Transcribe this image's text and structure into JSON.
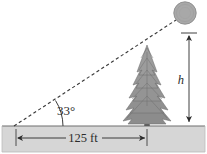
{
  "figure": {
    "type": "geometry-diagram",
    "labels": {
      "angle_of_elevation": "33°",
      "base_distance": "125 ft",
      "height_variable": "h"
    },
    "elements": {
      "sun": "sun-circle",
      "tree": "evergreen-tree",
      "ground": "ground-band",
      "hypotenuse": "dashed-sight-line",
      "height_dimension": "height-dimension-line",
      "base_dimension": "base-dimension-line",
      "angle_arc": "angle-arc"
    },
    "colors": {
      "sun_fill": "#a8a8a8",
      "sun_stroke": "#8a8a8a",
      "tree_fill": "#8c8c8c",
      "tree_dark": "#6e6e6e",
      "trunk": "#5a5a5a",
      "ground_fill": "#d6d6d6",
      "ground_stroke": "#8f8f8f",
      "line": "#2b2b2b",
      "dashed": "#4a4a4a",
      "text": "#2b2b2b",
      "background": "#ffffff"
    },
    "geometry": {
      "observer_x": 14,
      "observer_y": 126,
      "sun_center_x": 185,
      "sun_center_y": 13,
      "sun_radius": 11,
      "tree_base_x": 147,
      "tree_apex_y": 45,
      "ground_top_y": 126,
      "height_line_x": 189,
      "height_top_y": 33,
      "height_bottom_y": 125,
      "base_arrow_y": 138,
      "base_arrow_left_x": 16,
      "base_arrow_right_x": 147
    }
  }
}
